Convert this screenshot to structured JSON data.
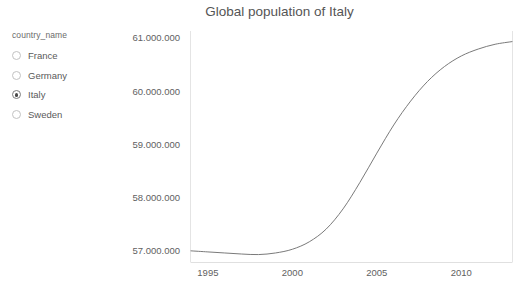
{
  "control": {
    "title": "country_name",
    "options": [
      {
        "label": "France",
        "selected": false
      },
      {
        "label": "Germany",
        "selected": false
      },
      {
        "label": "Italy",
        "selected": true
      },
      {
        "label": "Sweden",
        "selected": false
      }
    ]
  },
  "chart_data": {
    "type": "line",
    "title": "Global population of Italy",
    "xlabel": "",
    "ylabel": "",
    "xlim": [
      1994,
      2013
    ],
    "ylim": [
      56800000,
      61150000
    ],
    "xticks": [
      "1995",
      "2000",
      "2005",
      "2010"
    ],
    "xtick_values": [
      1995,
      2000,
      2005,
      2010
    ],
    "yticks": [
      "57.000.000",
      "58.000.000",
      "59.000.000",
      "60.000.000",
      "61.000.000"
    ],
    "ytick_values": [
      57000000,
      58000000,
      59000000,
      60000000,
      61000000
    ],
    "grid": false,
    "legend": "none",
    "line_color": "#7a7a7a",
    "series": [
      {
        "name": "Italy",
        "x": [
          1994,
          1995,
          1996,
          1997,
          1998,
          1999,
          2000,
          2001,
          2002,
          2003,
          2004,
          2005,
          2006,
          2007,
          2008,
          2009,
          2010,
          2011,
          2012,
          2013
        ],
        "values": [
          57010000,
          56990000,
          56970000,
          56950000,
          56940000,
          56970000,
          57040000,
          57180000,
          57420000,
          57800000,
          58300000,
          58850000,
          59380000,
          59830000,
          60200000,
          60480000,
          60680000,
          60810000,
          60900000,
          60950000
        ]
      }
    ]
  }
}
